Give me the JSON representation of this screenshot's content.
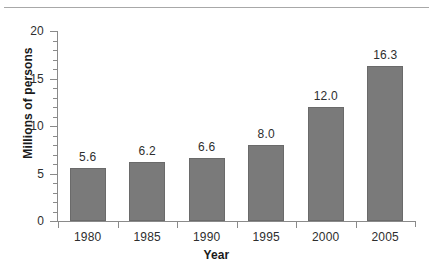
{
  "chart_data": {
    "type": "bar",
    "title": "",
    "xlabel": "Year",
    "ylabel": "Millions of persons",
    "categories": [
      "1980",
      "1985",
      "1990",
      "1995",
      "2000",
      "2005"
    ],
    "values": [
      5.6,
      6.2,
      6.6,
      8.0,
      12.0,
      16.3
    ],
    "data_labels": [
      "5.6",
      "6.2",
      "6.6",
      "8.0",
      "12.0",
      "16.3"
    ],
    "ylim": [
      0,
      20
    ],
    "ytick_labels": [
      "0",
      "5",
      "10",
      "15",
      "20"
    ],
    "ytick_values": [
      0,
      5,
      10,
      15,
      20
    ],
    "yminor_interval": 1,
    "grid": false,
    "legend": null,
    "bar_color": "#7a7a7a",
    "bar_edge_color": "#6a6a6a",
    "axis_color": "#8a8a8a",
    "text_color": "#2e2e2e"
  }
}
